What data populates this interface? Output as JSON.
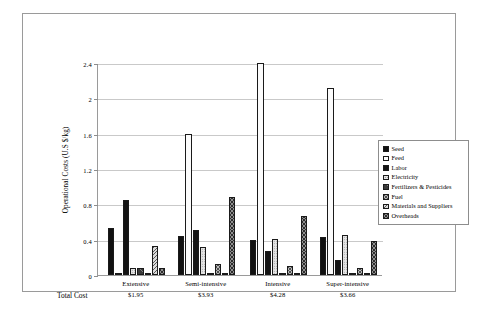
{
  "chart_data": {
    "type": "bar",
    "title": "",
    "xlabel": "",
    "ylabel": "Operational Costs (U.S $/kg)",
    "ylim": [
      0,
      2.4
    ],
    "yticks": [
      "0",
      "0.4",
      "0.8",
      "1.2",
      "1.6",
      "2",
      "2.4"
    ],
    "ytick_values": [
      0,
      0.4,
      0.8,
      1.2,
      1.6,
      2.0,
      2.4
    ],
    "grid": true,
    "legend_position": "right",
    "categories": [
      "Extensive",
      "Semi-intensive",
      "Intensive",
      "Super-intensive"
    ],
    "total_cost_label": "Total Cost",
    "total_costs": [
      "$1.95",
      "$3.93",
      "$4.28",
      "$3.66"
    ],
    "series": [
      {
        "name": "Seed",
        "pattern": "p-seed",
        "values": [
          0.53,
          0.44,
          0.4,
          0.43
        ]
      },
      {
        "name": "Feed",
        "pattern": "p-feed",
        "values": [
          0.0,
          1.6,
          2.4,
          2.12
        ]
      },
      {
        "name": "Labor",
        "pattern": "p-labor",
        "values": [
          0.85,
          0.51,
          0.27,
          0.17
        ]
      },
      {
        "name": "Electricity",
        "pattern": "p-elec",
        "values": [
          0.08,
          0.32,
          0.41,
          0.45
        ]
      },
      {
        "name": "Fertilizers & Pesticides",
        "pattern": "p-fert",
        "values": [
          0.08,
          0.01,
          0.01,
          0.01
        ]
      },
      {
        "name": "Fuel",
        "pattern": "p-fuel",
        "values": [
          0.0,
          0.13,
          0.1,
          0.08
        ]
      },
      {
        "name": "Materials and Suppliers",
        "pattern": "p-mats",
        "values": [
          0.33,
          0.01,
          0.01,
          0.01
        ]
      },
      {
        "name": "Overheads",
        "pattern": "p-over",
        "values": [
          0.08,
          0.88,
          0.67,
          0.38
        ]
      }
    ]
  },
  "colors": {
    "frame": "#9a9a9a",
    "gridline": "#c9c9c9",
    "bar_outline": "#1a1a1a",
    "background": "#ffffff"
  }
}
